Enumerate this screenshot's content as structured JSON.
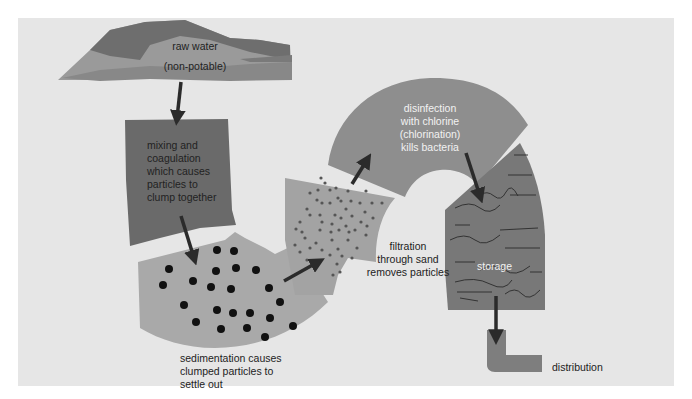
{
  "colors": {
    "background_panel": "#e6e6e6",
    "raw_water_light": "#9a9a9a",
    "raw_water_dark": "#6e6e6e",
    "mixing": "#6a6a6a",
    "sedimentation": "#a9a9a9",
    "filtration": "#a3a3a3",
    "disinfection": "#8e8e8e",
    "storage": "#787878",
    "distribution": "#7e7e7e",
    "arrow": "#2b2b2b",
    "particles": "#111111"
  },
  "stages": {
    "raw_water": {
      "line1": "raw water",
      "line2": "(non-potable)"
    },
    "mixing": {
      "lines": [
        "mixing and",
        "coagulation",
        "which causes",
        "particles to",
        "clump together"
      ]
    },
    "sedimentation": {
      "lines": [
        "sedimentation causes",
        "clumped particles to",
        "settle out"
      ]
    },
    "filtration": {
      "lines": [
        "filtration",
        "through sand",
        "removes particles"
      ]
    },
    "disinfection": {
      "lines": [
        "disinfection",
        "with chlorine",
        "(chlorination)",
        "kills bacteria"
      ]
    },
    "storage": {
      "label": "storage"
    },
    "distribution": {
      "label": "distribution"
    }
  }
}
